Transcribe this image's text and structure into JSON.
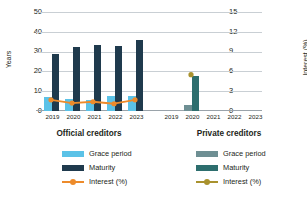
{
  "chart_data": {
    "type": "bar",
    "title": "",
    "subtitle": "",
    "categories": [
      "2019",
      "2020",
      "2021",
      "2022",
      "2023"
    ],
    "ylabel": "Years",
    "y2label": "Interest (%)",
    "xlabel": "",
    "ylim": [
      0,
      50
    ],
    "y2lim": [
      0,
      15
    ],
    "yticks": [
      "0",
      "10",
      "20",
      "30",
      "40",
      "50"
    ],
    "y2ticks": [
      "0",
      "3",
      "6",
      "9",
      "12",
      "15"
    ],
    "grid": true,
    "legend_position": "bottom",
    "groups": [
      {
        "name": "Official creditors",
        "series": [
          {
            "name": "Grace period",
            "axis": "left",
            "type": "bar",
            "color": "#5BC2E7",
            "values": [
              7.2,
              6.3,
              5.8,
              7.6,
              7.6
            ]
          },
          {
            "name": "Maturity",
            "axis": "left",
            "type": "bar",
            "color": "#1F3A4D",
            "values": [
              29.0,
              32.2,
              33.4,
              33.0,
              36.0
            ]
          },
          {
            "name": "Interest (%)",
            "axis": "right",
            "type": "line",
            "color": "#ED8B2B",
            "values": [
              1.7,
              1.2,
              1.4,
              1.1,
              1.7
            ]
          }
        ]
      },
      {
        "name": "Private creditors",
        "series": [
          {
            "name": "Grace period",
            "axis": "left",
            "type": "bar",
            "color": "#6E8F93",
            "values": [
              null,
              2.8,
              null,
              null,
              null
            ]
          },
          {
            "name": "Maturity",
            "axis": "left",
            "type": "bar",
            "color": "#2D6E6E",
            "values": [
              null,
              17.8,
              null,
              null,
              null
            ]
          },
          {
            "name": "Interest (%)",
            "axis": "right",
            "type": "line",
            "color": "#A9922E",
            "values": [
              null,
              5.5,
              null,
              null,
              null
            ]
          }
        ]
      }
    ]
  },
  "axes": {
    "left_title": "Years",
    "right_title": "Interest (%)",
    "left_ticks": [
      "50",
      "40",
      "30",
      "20",
      "10",
      "0"
    ],
    "right_ticks": [
      "15",
      "12",
      "9",
      "6",
      "3",
      "0"
    ]
  },
  "xaxis": {
    "official_years": [
      "2019",
      "2020",
      "2021",
      "2022",
      "2023"
    ],
    "private_years": [
      "2019",
      "2020",
      "2021",
      "2022",
      "2023"
    ]
  },
  "captions": {
    "official": "Official creditors",
    "private": "Private creditors"
  },
  "legend": {
    "official": [
      {
        "label": "Grace period",
        "color": "#5BC2E7",
        "marker": "bar"
      },
      {
        "label": "Maturity",
        "color": "#1F3A4D",
        "marker": "bar"
      },
      {
        "label": "Interest (%)",
        "color": "#ED8B2B",
        "marker": "line"
      }
    ],
    "private": [
      {
        "label": "Grace period",
        "color": "#6E8F93",
        "marker": "bar"
      },
      {
        "label": "Maturity",
        "color": "#2D6E6E",
        "marker": "bar"
      },
      {
        "label": "Interest (%)",
        "color": "#A9922E",
        "marker": "line"
      }
    ]
  },
  "colors": {
    "grid": "#c9cfd4",
    "text": "#231f20",
    "background": "#ffffff"
  }
}
